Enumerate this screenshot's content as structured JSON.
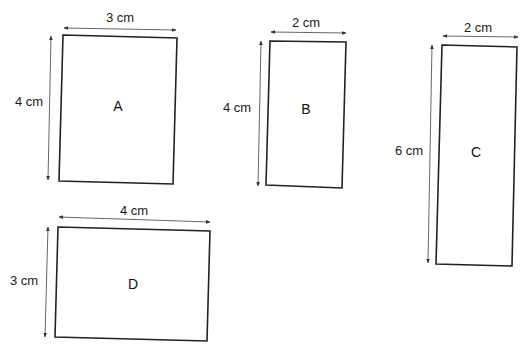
{
  "diagram": {
    "type": "rectangles-with-dimensions",
    "unit": "cm",
    "colors": {
      "outline": "#222222",
      "arrow": "#555555",
      "text": "#1a1a1a",
      "background": "#ffffff"
    },
    "shapes": [
      {
        "id": "A",
        "label": "A",
        "width_label": "3 cm",
        "height_label": "4 cm",
        "width_cm": 3,
        "height_cm": 4,
        "corners": [
          [
            63,
            35
          ],
          [
            177,
            38
          ],
          [
            173,
            184
          ],
          [
            59,
            181
          ]
        ],
        "label_pos": [
          118,
          111
        ],
        "h_arrow": [
          [
            64,
            28
          ],
          [
            176,
            30
          ]
        ],
        "h_label_pos": [
          120,
          22
        ],
        "v_arrow": [
          [
            51,
            36
          ],
          [
            48,
            180
          ]
        ],
        "v_label_pos": [
          29,
          106
        ]
      },
      {
        "id": "B",
        "label": "B",
        "width_label": "2 cm",
        "height_label": "4 cm",
        "width_cm": 2,
        "height_cm": 4,
        "corners": [
          [
            270,
            41
          ],
          [
            346,
            42
          ],
          [
            342,
            188
          ],
          [
            266,
            185
          ]
        ],
        "label_pos": [
          306,
          114
        ],
        "h_arrow": [
          [
            271,
            32
          ],
          [
            346,
            33
          ]
        ],
        "h_label_pos": [
          306,
          27
        ],
        "v_arrow": [
          [
            261,
            41
          ],
          [
            258,
            186
          ]
        ],
        "v_label_pos": [
          237,
          112
        ]
      },
      {
        "id": "C",
        "label": "C",
        "width_label": "2 cm",
        "height_label": "6 cm",
        "width_cm": 2,
        "height_cm": 6,
        "corners": [
          [
            442,
            45
          ],
          [
            517,
            47
          ],
          [
            512,
            266
          ],
          [
            436,
            264
          ]
        ],
        "label_pos": [
          476,
          157
        ],
        "h_arrow": [
          [
            443,
            36
          ],
          [
            518,
            37
          ]
        ],
        "h_label_pos": [
          478,
          32
        ],
        "v_arrow": [
          [
            432,
            45
          ],
          [
            428,
            263
          ]
        ],
        "v_label_pos": [
          409,
          155
        ]
      },
      {
        "id": "D",
        "label": "D",
        "width_label": "4 cm",
        "height_label": "3 cm",
        "width_cm": 4,
        "height_cm": 3,
        "corners": [
          [
            58,
            227
          ],
          [
            210,
            231
          ],
          [
            207,
            341
          ],
          [
            55,
            337
          ]
        ],
        "label_pos": [
          133,
          289
        ],
        "h_arrow": [
          [
            59,
            217
          ],
          [
            210,
            222
          ]
        ],
        "h_label_pos": [
          134,
          215
        ],
        "v_arrow": [
          [
            48,
            227
          ],
          [
            45,
            337
          ]
        ],
        "v_label_pos": [
          24,
          285
        ]
      }
    ]
  }
}
